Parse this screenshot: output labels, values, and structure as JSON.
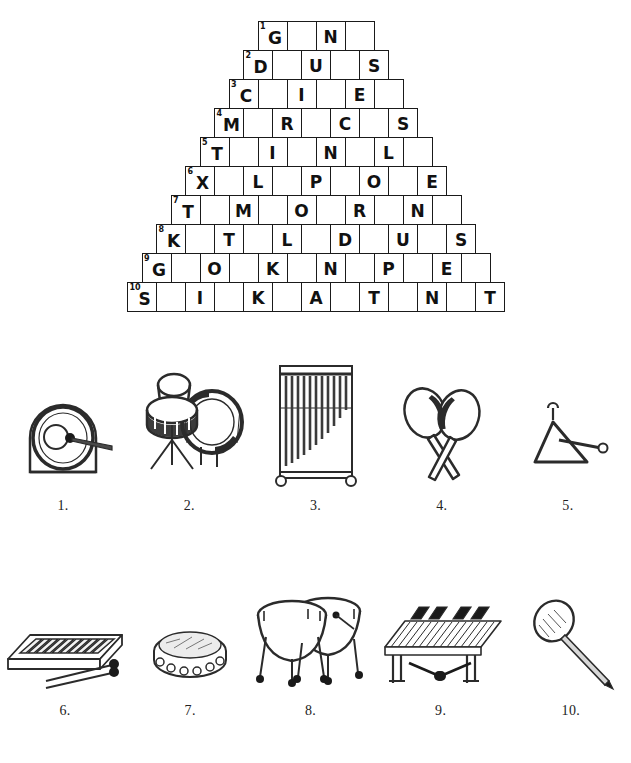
{
  "worksheet": {
    "title": "Percussion Instruments Pyramid Puzzle"
  },
  "puzzle": {
    "type": "pyramid-crossword",
    "rows": [
      {
        "number": "1",
        "cells": [
          "G",
          "",
          "N",
          ""
        ]
      },
      {
        "number": "2",
        "cells": [
          "D",
          "",
          "U",
          "",
          "S"
        ]
      },
      {
        "number": "3",
        "cells": [
          "C",
          "",
          "I",
          "",
          "E",
          ""
        ]
      },
      {
        "number": "4",
        "cells": [
          "M",
          "",
          "R",
          "",
          "C",
          "",
          "S"
        ]
      },
      {
        "number": "5",
        "cells": [
          "T",
          "",
          "I",
          "",
          "N",
          "",
          "L",
          ""
        ]
      },
      {
        "number": "6",
        "cells": [
          "X",
          "",
          "L",
          "",
          "P",
          "",
          "O",
          "",
          "E"
        ]
      },
      {
        "number": "7",
        "cells": [
          "T",
          "",
          "M",
          "",
          "O",
          "",
          "R",
          "",
          "N",
          ""
        ]
      },
      {
        "number": "8",
        "cells": [
          "K",
          "",
          "T",
          "",
          "L",
          "",
          "D",
          "",
          "U",
          "",
          "S"
        ]
      },
      {
        "number": "9",
        "cells": [
          "G",
          "",
          "O",
          "",
          "K",
          "",
          "N",
          "",
          "P",
          "",
          "E",
          ""
        ]
      },
      {
        "number": "10",
        "cells": [
          "S",
          "",
          "I",
          "",
          "K",
          "",
          "A",
          "",
          "T",
          "",
          "N",
          "",
          "T"
        ]
      }
    ]
  },
  "pictures": {
    "top_row": [
      {
        "caption": "1.",
        "icon": "gong-icon"
      },
      {
        "caption": "2.",
        "icon": "drum-set-icon"
      },
      {
        "caption": "3.",
        "icon": "chimes-icon"
      },
      {
        "caption": "4.",
        "icon": "maracas-icon"
      },
      {
        "caption": "5.",
        "icon": "triangle-icon"
      }
    ],
    "bottom_row": [
      {
        "caption": "6.",
        "icon": "xylophone-icon"
      },
      {
        "caption": "7.",
        "icon": "tambourine-icon"
      },
      {
        "caption": "8.",
        "icon": "timpani-icon"
      },
      {
        "caption": "9.",
        "icon": "marimba-icon"
      },
      {
        "caption": "10.",
        "icon": "mallet-icon"
      }
    ]
  },
  "colors": {
    "ink": "#1a1a1a",
    "paper": "#ffffff",
    "art": "#2b2b2b"
  }
}
